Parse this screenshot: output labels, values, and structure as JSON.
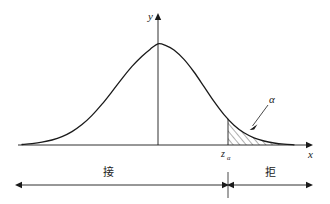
{
  "figure": {
    "title": "",
    "background_color": "#ffffff",
    "stroke_color": "#1a1a1a",
    "width": 330,
    "height": 204
  },
  "axes": {
    "y_axis_label": "y",
    "x_axis_label": "x",
    "origin_x": 158,
    "baseline_y": 145,
    "x_axis_start": 18,
    "x_axis_end": 312,
    "y_axis_top": 14
  },
  "annotations": {
    "alpha_label": "α",
    "critical_value_base": "z",
    "critical_value_subscript": "α",
    "accept_region_label": "接",
    "reject_region_label": "拒"
  },
  "chart_data": {
    "type": "line",
    "title": "",
    "xlabel": "x",
    "ylabel": "y",
    "grid": false,
    "legend": "none",
    "curve_name": "standard-normal-density",
    "critical_value_x_px": 228,
    "shaded_region": {
      "name": "rejection-region",
      "from_x_px": 228,
      "to_x_px": 294,
      "fill_pattern": "diagonal-hatch",
      "area_label": "α"
    },
    "curve_points_px": [
      [
        22,
        144.5
      ],
      [
        32,
        143.6
      ],
      [
        42,
        142.2
      ],
      [
        52,
        140.0
      ],
      [
        62,
        136.6
      ],
      [
        72,
        131.6
      ],
      [
        82,
        124.6
      ],
      [
        92,
        115.4
      ],
      [
        102,
        104.2
      ],
      [
        112,
        91.6
      ],
      [
        122,
        78.6
      ],
      [
        132,
        66.4
      ],
      [
        142,
        56.2
      ],
      [
        150,
        49.4
      ],
      [
        158,
        43.8
      ],
      [
        166,
        45.6
      ],
      [
        174,
        50.0
      ],
      [
        184,
        59.4
      ],
      [
        194,
        72.0
      ],
      [
        204,
        86.6
      ],
      [
        214,
        101.4
      ],
      [
        224,
        114.6
      ],
      [
        234,
        125.2
      ],
      [
        244,
        132.8
      ],
      [
        254,
        137.8
      ],
      [
        264,
        141.0
      ],
      [
        274,
        143.0
      ],
      [
        284,
        144.2
      ],
      [
        294,
        144.8
      ]
    ]
  },
  "bottom_ruler": {
    "left_arrow_from_x": 18,
    "left_arrow_to_x": 225,
    "divider_x": 228,
    "right_arrow_from_x": 231,
    "right_arrow_to_x": 312,
    "line_y": 185,
    "accept_label_x": 108,
    "reject_label_x": 270,
    "label_y": 172
  }
}
